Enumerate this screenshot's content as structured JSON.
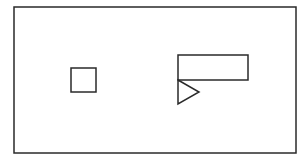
{
  "diagram": {
    "background": "#ffffff",
    "stroke_color": "#2a2a2a",
    "frame": {
      "x": 14,
      "y": 7,
      "width": 282,
      "height": 146
    },
    "square": {
      "x": 71,
      "y": 68,
      "width": 25,
      "height": 24
    },
    "rectangle": {
      "x": 178,
      "y": 55,
      "width": 70,
      "height": 25
    },
    "triangle": {
      "points": "178,80 199,92 178,104"
    }
  }
}
